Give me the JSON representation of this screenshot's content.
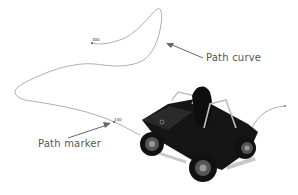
{
  "annotations": {
    "path_curve_label": "Path curve",
    "path_marker_label": "Path marker"
  },
  "markers": {
    "start_value": "300",
    "marker_value": "140"
  },
  "colors": {
    "curve": "#9a9a9a",
    "arrow": "#666666",
    "text": "#555555",
    "vehicle": "#111111"
  }
}
